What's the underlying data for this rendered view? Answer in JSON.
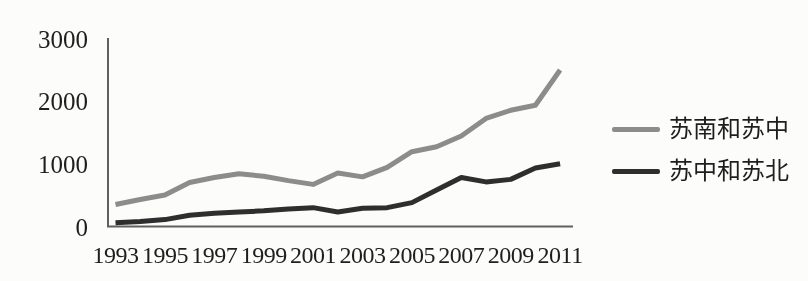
{
  "figure": {
    "background_color": "#fcfcfb",
    "axis_color": "#606060",
    "text_color": "#1e1e1e"
  },
  "chart_data": {
    "type": "line",
    "title": "",
    "xlabel": "",
    "ylabel": "",
    "x": [
      1993,
      1994,
      1995,
      1996,
      1997,
      1998,
      1999,
      2000,
      2001,
      2002,
      2003,
      2004,
      2005,
      2006,
      2007,
      2008,
      2009,
      2010,
      2011
    ],
    "xtick_labels": [
      "1993",
      "1995",
      "1997",
      "1999",
      "2001",
      "2003",
      "2005",
      "2007",
      "2009",
      "2011"
    ],
    "yticks": [
      0,
      1000,
      2000,
      3000
    ],
    "ytick_labels": [
      "0",
      "1000",
      "2000",
      "3000"
    ],
    "ylim": [
      0,
      3000
    ],
    "grid": false,
    "legend_position": "right",
    "series": [
      {
        "name": "苏南和苏中",
        "color": "#8c8c8c",
        "values": [
          350,
          430,
          500,
          700,
          780,
          840,
          800,
          730,
          670,
          850,
          790,
          940,
          1190,
          1270,
          1440,
          1720,
          1850,
          1930,
          2490
        ]
      },
      {
        "name": "苏中和苏北",
        "color": "#2e2e2e",
        "values": [
          60,
          80,
          110,
          180,
          210,
          230,
          250,
          280,
          300,
          230,
          290,
          300,
          380,
          580,
          780,
          710,
          750,
          930,
          1000
        ]
      }
    ]
  }
}
